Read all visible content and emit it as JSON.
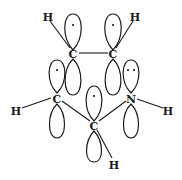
{
  "diagram": {
    "atoms": [
      {
        "id": "H1",
        "label": "H",
        "x": 48,
        "y": 17
      },
      {
        "id": "H2",
        "label": "H",
        "x": 135,
        "y": 17
      },
      {
        "id": "C1",
        "label": "C",
        "x": 73,
        "y": 54
      },
      {
        "id": "C2",
        "label": "C",
        "x": 113,
        "y": 54
      },
      {
        "id": "C3",
        "label": "C",
        "x": 57,
        "y": 99
      },
      {
        "id": "N",
        "label": "N",
        "x": 131,
        "y": 99
      },
      {
        "id": "H3",
        "label": "H",
        "x": 16,
        "y": 111
      },
      {
        "id": "H4",
        "label": "H",
        "x": 168,
        "y": 111
      },
      {
        "id": "C4",
        "label": "C",
        "x": 94,
        "y": 126
      },
      {
        "id": "H5",
        "label": "H",
        "x": 114,
        "y": 165
      }
    ],
    "electrons": {
      "C1": "•",
      "C2": "•",
      "C3": "•",
      "C4": "•",
      "N": "••"
    }
  }
}
